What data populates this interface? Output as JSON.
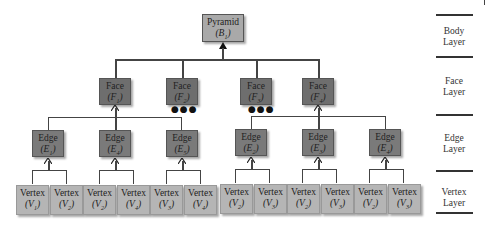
{
  "diagram": {
    "type": "hierarchy-tree",
    "body": {
      "label": "Pyramid",
      "symbol": "B",
      "subscript": "1"
    },
    "faces": [
      {
        "label": "Face",
        "symbol": "F",
        "subscript": "1",
        "ellipsis_below": false
      },
      {
        "label": "Face",
        "symbol": "F",
        "subscript": "2",
        "ellipsis_below": true
      },
      {
        "label": "Face",
        "symbol": "F",
        "subscript": "3",
        "ellipsis_below": true
      },
      {
        "label": "Face",
        "symbol": "F",
        "subscript": "4",
        "ellipsis_below": false
      }
    ],
    "ellipsis": "●●●",
    "edges": [
      {
        "label": "Edge",
        "symbol": "E",
        "subscript": "1"
      },
      {
        "label": "Edge",
        "symbol": "E",
        "subscript": "4"
      },
      {
        "label": "Edge",
        "symbol": "E",
        "subscript": "5"
      },
      {
        "label": "Edge",
        "symbol": "E",
        "subscript": "2"
      },
      {
        "label": "Edge",
        "symbol": "E",
        "subscript": "3"
      },
      {
        "label": "Edge",
        "symbol": "E",
        "subscript": "4"
      }
    ],
    "vertices": [
      {
        "label": "Vertex",
        "symbol": "V",
        "subscript": "1"
      },
      {
        "label": "Vertex",
        "symbol": "V",
        "subscript": "2"
      },
      {
        "label": "Vertex",
        "symbol": "V",
        "subscript": "2"
      },
      {
        "label": "Vertex",
        "symbol": "V",
        "subscript": "4"
      },
      {
        "label": "Vertex",
        "symbol": "V",
        "subscript": "3"
      },
      {
        "label": "Vertex",
        "symbol": "V",
        "subscript": "4"
      },
      {
        "label": "Vertex",
        "symbol": "V",
        "subscript": "2"
      },
      {
        "label": "Vertex",
        "symbol": "V",
        "subscript": "3"
      },
      {
        "label": "Vertex",
        "symbol": "V",
        "subscript": "2"
      },
      {
        "label": "Vertex",
        "symbol": "V",
        "subscript": "3"
      },
      {
        "label": "Vertex",
        "symbol": "V",
        "subscript": "2"
      },
      {
        "label": "Vertex",
        "symbol": "V",
        "subscript": "3"
      }
    ],
    "layers": [
      {
        "line1": "Body",
        "line2": "Layer"
      },
      {
        "line1": "Face",
        "line2": "Layer"
      },
      {
        "line1": "Edge",
        "line2": "Layer"
      },
      {
        "line1": "Vertex",
        "line2": "Layer"
      }
    ],
    "colors": {
      "body_fill": "#a9a9a9",
      "face_fill": "#6e6e6e",
      "edge_fill": "#7a7a7a",
      "vertex_fill": "#b5b5b5",
      "connector": "#444444"
    }
  }
}
